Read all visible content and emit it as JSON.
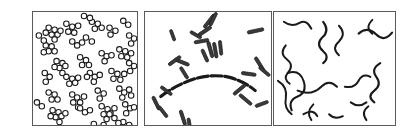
{
  "figure": {
    "background_color": "#ffffff",
    "width": 403,
    "height": 136,
    "border_color": "#5a5a5a",
    "ink_color": "#1a1a1a"
  },
  "panels": [
    {
      "id": "panel-cocci",
      "name": "cocci-panel",
      "label": "",
      "morphology": "coccus",
      "arrangement": "staphylococcus-grape-like-clusters",
      "shape_primitive": "circle",
      "fill": "#ffffff",
      "stroke": "#1a1a1a",
      "cell_diameter_px": 5.6,
      "stroke_width_px": 1.1,
      "cell_count": 196,
      "cluster_count": 33,
      "frame": {
        "x": 32,
        "y": 11,
        "width": 106,
        "height": 115
      }
    },
    {
      "id": "panel-bacilli",
      "name": "bacilli-panel",
      "label": "",
      "morphology": "bacillus",
      "arrangement": "single-rods-v-forms-and-filament-chain",
      "shape_primitive": "rod",
      "fill": "#3a3a3a",
      "stroke": "#1a1a1a",
      "rod_length_px": 14,
      "rod_width_px": 3.2,
      "rod_count": 34,
      "chain_count": 2,
      "frame": {
        "x": 144,
        "y": 11,
        "width": 128,
        "height": 115
      }
    },
    {
      "id": "panel-spirilla",
      "name": "spirilla-panel",
      "label": "",
      "morphology": "spirillum",
      "arrangement": "loose-helices-s-curves-and-commas",
      "shape_primitive": "wavy-filament",
      "fill": "none",
      "stroke": "#1a1a1a",
      "filament_width_px": 2.0,
      "filament_count": 16,
      "frame": {
        "x": 273,
        "y": 11,
        "width": 123,
        "height": 115
      }
    }
  ],
  "cocci_clusters": [
    {
      "cx": 16,
      "cy": 16,
      "cells": [
        [
          0,
          0
        ],
        [
          6,
          2
        ],
        [
          3,
          7
        ],
        [
          9,
          7
        ],
        [
          -3,
          5
        ],
        [
          6,
          12
        ],
        [
          12,
          3
        ]
      ]
    },
    {
      "cx": 34,
      "cy": 12,
      "cells": [
        [
          0,
          0
        ],
        [
          6,
          3
        ],
        [
          2,
          8
        ],
        [
          8,
          9
        ],
        [
          12,
          2
        ]
      ]
    },
    {
      "cx": 13,
      "cy": 34,
      "cells": [
        [
          0,
          0
        ],
        [
          6,
          1
        ],
        [
          3,
          6
        ],
        [
          9,
          6
        ],
        [
          -2,
          7
        ]
      ]
    },
    {
      "cx": 40,
      "cy": 30,
      "cells": [
        [
          0,
          0
        ],
        [
          5,
          4
        ],
        [
          10,
          1
        ]
      ]
    },
    {
      "cx": 60,
      "cy": 10,
      "cells": [
        [
          0,
          0
        ],
        [
          6,
          2
        ],
        [
          3,
          7
        ],
        [
          10,
          6
        ]
      ]
    },
    {
      "cx": 78,
      "cy": 16,
      "cells": [
        [
          0,
          0
        ],
        [
          6,
          3
        ],
        [
          1,
          7
        ]
      ]
    },
    {
      "cx": 92,
      "cy": 9,
      "cells": [
        [
          0,
          0
        ],
        [
          5,
          4
        ]
      ]
    },
    {
      "cx": 24,
      "cy": 50,
      "cells": [
        [
          0,
          0
        ],
        [
          6,
          2
        ],
        [
          3,
          7
        ],
        [
          9,
          5
        ],
        [
          -2,
          6
        ],
        [
          6,
          12
        ]
      ]
    },
    {
      "cx": 48,
      "cy": 46,
      "cells": [
        [
          0,
          0
        ],
        [
          6,
          3
        ],
        [
          2,
          8
        ],
        [
          9,
          8
        ]
      ]
    },
    {
      "cx": 70,
      "cy": 42,
      "cells": [
        [
          0,
          0
        ],
        [
          5,
          3
        ],
        [
          10,
          2
        ],
        [
          3,
          8
        ]
      ]
    },
    {
      "cx": 88,
      "cy": 38,
      "cells": [
        [
          0,
          0
        ],
        [
          6,
          2
        ],
        [
          2,
          7
        ],
        [
          8,
          8
        ],
        [
          12,
          4
        ]
      ]
    },
    {
      "cx": 12,
      "cy": 62,
      "cells": [
        [
          0,
          0
        ],
        [
          5,
          4
        ],
        [
          1,
          9
        ]
      ]
    },
    {
      "cx": 34,
      "cy": 66,
      "cells": [
        [
          0,
          0
        ],
        [
          6,
          2
        ],
        [
          3,
          7
        ],
        [
          9,
          6
        ],
        [
          12,
          1
        ]
      ]
    },
    {
      "cx": 58,
      "cy": 62,
      "cells": [
        [
          0,
          0
        ],
        [
          5,
          4
        ],
        [
          10,
          2
        ],
        [
          4,
          9
        ],
        [
          -3,
          4
        ]
      ]
    },
    {
      "cx": 80,
      "cy": 60,
      "cells": [
        [
          0,
          0
        ],
        [
          6,
          3
        ],
        [
          2,
          8
        ],
        [
          9,
          9
        ],
        [
          13,
          3
        ]
      ]
    },
    {
      "cx": 16,
      "cy": 82,
      "cells": [
        [
          0,
          0
        ],
        [
          6,
          2
        ],
        [
          3,
          7
        ],
        [
          9,
          7
        ]
      ]
    },
    {
      "cx": 40,
      "cy": 84,
      "cells": [
        [
          0,
          0
        ],
        [
          5,
          3
        ],
        [
          1,
          8
        ],
        [
          8,
          8
        ],
        [
          12,
          2
        ],
        [
          6,
          13
        ]
      ]
    },
    {
      "cx": 66,
      "cy": 80,
      "cells": [
        [
          0,
          0
        ],
        [
          6,
          3
        ],
        [
          2,
          8
        ]
      ]
    },
    {
      "cx": 88,
      "cy": 78,
      "cells": [
        [
          0,
          0
        ],
        [
          5,
          4
        ],
        [
          10,
          1
        ],
        [
          3,
          9
        ],
        [
          12,
          7
        ]
      ]
    },
    {
      "cx": 20,
      "cy": 100,
      "cells": [
        [
          0,
          0
        ],
        [
          6,
          2
        ],
        [
          3,
          7
        ],
        [
          9,
          6
        ],
        [
          -2,
          6
        ],
        [
          7,
          12
        ],
        [
          13,
          3
        ]
      ]
    },
    {
      "cx": 48,
      "cy": 98,
      "cells": [
        [
          0,
          0
        ],
        [
          5,
          4
        ],
        [
          10,
          2
        ]
      ]
    },
    {
      "cx": 70,
      "cy": 96,
      "cells": [
        [
          0,
          0
        ],
        [
          6,
          3
        ],
        [
          2,
          8
        ],
        [
          9,
          7
        ],
        [
          13,
          2
        ],
        [
          5,
          13
        ]
      ]
    },
    {
      "cx": 94,
      "cy": 94,
      "cells": [
        [
          0,
          0
        ],
        [
          5,
          4
        ],
        [
          1,
          9
        ],
        [
          9,
          3
        ]
      ]
    },
    {
      "cx": 6,
      "cy": 24,
      "cells": [
        [
          0,
          0
        ],
        [
          5,
          5
        ]
      ]
    },
    {
      "cx": 98,
      "cy": 24,
      "cells": [
        [
          0,
          0
        ],
        [
          5,
          3
        ],
        [
          2,
          8
        ]
      ]
    },
    {
      "cx": 54,
      "cy": 26,
      "cells": [
        [
          0,
          0
        ],
        [
          6,
          4
        ]
      ]
    },
    {
      "cx": 28,
      "cy": 118,
      "cells": [
        [
          0,
          0
        ],
        [
          6,
          2
        ],
        [
          3,
          6
        ]
      ]
    },
    {
      "cx": 62,
      "cy": 114,
      "cells": [
        [
          0,
          0
        ],
        [
          5,
          4
        ],
        [
          10,
          1
        ]
      ]
    },
    {
      "cx": 92,
      "cy": 112,
      "cells": [
        [
          0,
          0
        ],
        [
          6,
          3
        ],
        [
          2,
          8
        ],
        [
          9,
          6
        ]
      ]
    },
    {
      "cx": 4,
      "cy": 92,
      "cells": [
        [
          0,
          0
        ],
        [
          5,
          4
        ]
      ]
    },
    {
      "cx": 98,
      "cy": 52,
      "cells": [
        [
          0,
          0
        ],
        [
          5,
          3
        ],
        [
          1,
          8
        ]
      ]
    },
    {
      "cx": 52,
      "cy": 4,
      "cells": [
        [
          0,
          0
        ],
        [
          6,
          2
        ]
      ]
    },
    {
      "cx": 78,
      "cy": 104,
      "cells": [
        [
          0,
          0
        ],
        [
          5,
          4
        ],
        [
          9,
          9
        ]
      ]
    }
  ],
  "bacilli_rods": [
    {
      "x": 60,
      "y": 16,
      "len": 17,
      "w": 3.3,
      "rot": -52
    },
    {
      "x": 66,
      "y": 14,
      "len": 15,
      "w": 3.2,
      "rot": -64
    },
    {
      "x": 54,
      "y": 24,
      "len": 16,
      "w": 3.4,
      "rot": -34
    },
    {
      "x": 50,
      "y": 31,
      "len": 15,
      "w": 3.2,
      "rot": -10
    },
    {
      "x": 64,
      "y": 30,
      "len": 17,
      "w": 3.3,
      "rot": 74
    },
    {
      "x": 70,
      "y": 31,
      "len": 16,
      "w": 3.2,
      "rot": 80
    },
    {
      "x": 76,
      "y": 29,
      "len": 15,
      "w": 3.1,
      "rot": 84
    },
    {
      "x": 58,
      "y": 38,
      "len": 14,
      "w": 3.2,
      "rot": 66
    },
    {
      "x": 46,
      "y": 20,
      "len": 13,
      "w": 3.0,
      "rot": 30
    },
    {
      "x": 104,
      "y": 21,
      "len": 17,
      "w": 3.3,
      "rot": -12
    },
    {
      "x": 30,
      "y": 48,
      "len": 16,
      "w": 3.2,
      "rot": 22
    },
    {
      "x": 24,
      "y": 54,
      "len": 15,
      "w": 3.2,
      "rot": -36
    },
    {
      "x": 36,
      "y": 56,
      "len": 14,
      "w": 3.1,
      "rot": 58
    },
    {
      "x": 112,
      "y": 46,
      "len": 17,
      "w": 3.3,
      "rot": 58
    },
    {
      "x": 116,
      "y": 56,
      "len": 14,
      "w": 3.1,
      "rot": 40
    },
    {
      "x": 98,
      "y": 62,
      "len": 15,
      "w": 3.2,
      "rot": 8
    },
    {
      "x": 16,
      "y": 76,
      "len": 14,
      "w": 3.1,
      "rot": 36
    },
    {
      "x": 8,
      "y": 86,
      "len": 15,
      "w": 3.2,
      "rot": 64
    },
    {
      "x": 14,
      "y": 96,
      "len": 14,
      "w": 3.1,
      "rot": 52
    },
    {
      "x": 36,
      "y": 100,
      "len": 16,
      "w": 3.2,
      "rot": 72
    },
    {
      "x": 44,
      "y": 108,
      "len": 14,
      "w": 3.1,
      "rot": 80
    },
    {
      "x": 90,
      "y": 84,
      "len": 16,
      "w": 3.2,
      "rot": -40
    },
    {
      "x": 96,
      "y": 84,
      "len": 16,
      "w": 3.2,
      "rot": 40
    },
    {
      "x": 112,
      "y": 96,
      "len": 14,
      "w": 3.1,
      "rot": -20
    },
    {
      "x": 26,
      "y": 18,
      "len": 12,
      "w": 2.9,
      "rot": 70
    }
  ],
  "bacilli_chain_path": "M 16 86 Q 26 78 40 72 Q 62 62 84 66 Q 100 70 112 80",
  "bacilli_chain_segments": 13,
  "spirilla_filaments": [
    {
      "path": "M 10 10 q 8 6 16 1 q 7 -4 12 6",
      "w": 2.0
    },
    {
      "path": "M 12 34 q -7 8 1 14 q 8 6 1 14 q -5 6 2 11",
      "w": 2.0
    },
    {
      "path": "M 50 10 q 7 9 -1 16 q -7 7 1 14 q 7 6 0 12",
      "w": 2.2
    },
    {
      "path": "M 66 14 q 8 8 0 16 q -8 7 0 14",
      "w": 2.0
    },
    {
      "path": "M 86 22 q 9 -8 18 1 q 8 8 16 -2",
      "w": 2.2
    },
    {
      "path": "M 14 62 q 12 -4 16 8 q 4 12 -6 16 q -10 4 -6 14",
      "w": 2.1
    },
    {
      "path": "M 4 70 q 10 6 8 18 q -2 10 6 16",
      "w": 2.0
    },
    {
      "path": "M 24 80 q 14 6 24 -4 q 8 -8 16 0",
      "w": 2.1
    },
    {
      "path": "M 40 94 q -8 8 -2 16",
      "w": 2.0
    },
    {
      "path": "M 108 52 q -10 6 -4 14 q 6 8 -2 14 q -8 6 0 12",
      "w": 2.2
    },
    {
      "path": "M 72 76 q 10 2 14 -6 q 4 -8 12 -4",
      "w": 2.0
    },
    {
      "path": "M 78 92 q 8 6 16 0",
      "w": 2.0
    },
    {
      "path": "M 96 96 q -8 6 -2 14",
      "w": 2.0
    },
    {
      "path": "M 100 8 q -8 8 0 14",
      "w": 2.0
    },
    {
      "path": "M 30 104 q 10 -6 14 2",
      "w": 2.0
    },
    {
      "path": "M 56 104 q 6 6 14 2",
      "w": 2.0
    }
  ]
}
